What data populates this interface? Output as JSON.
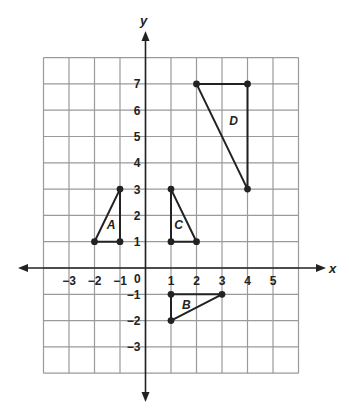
{
  "graph": {
    "x_axis_label": "x",
    "y_axis_label": "y",
    "grid": {
      "x_min": -4,
      "x_max": 6,
      "y_min": -4,
      "y_max": 8
    },
    "x_tick_labels": [
      {
        "value": -3,
        "label": "−3"
      },
      {
        "value": -2,
        "label": "−2"
      },
      {
        "value": -1,
        "label": "−1"
      },
      {
        "value": 1,
        "label": "1"
      },
      {
        "value": 2,
        "label": "2"
      },
      {
        "value": 3,
        "label": "3"
      },
      {
        "value": 4,
        "label": "4"
      },
      {
        "value": 5,
        "label": "5"
      }
    ],
    "y_tick_labels": [
      {
        "value": 7,
        "label": "7"
      },
      {
        "value": 6,
        "label": "6"
      },
      {
        "value": 5,
        "label": "5"
      },
      {
        "value": 4,
        "label": "4"
      },
      {
        "value": 3,
        "label": "3"
      },
      {
        "value": 2,
        "label": "2"
      },
      {
        "value": 1,
        "label": "1"
      },
      {
        "value": -1,
        "label": "−1"
      },
      {
        "value": -2,
        "label": "−2"
      },
      {
        "value": -3,
        "label": "−3"
      }
    ],
    "origin_label": "0",
    "triangles": [
      {
        "name": "A",
        "vertices": [
          [
            -2,
            1
          ],
          [
            -1,
            1
          ],
          [
            -1,
            3
          ]
        ],
        "label_pos": [
          -1.35,
          1.65
        ]
      },
      {
        "name": "B",
        "vertices": [
          [
            1,
            -1
          ],
          [
            3,
            -1
          ],
          [
            1,
            -2
          ]
        ],
        "label_pos": [
          1.6,
          -1.4
        ]
      },
      {
        "name": "C",
        "vertices": [
          [
            1,
            1
          ],
          [
            2,
            1
          ],
          [
            1,
            3
          ]
        ],
        "label_pos": [
          1.3,
          1.65
        ]
      },
      {
        "name": "D",
        "vertices": [
          [
            2,
            7
          ],
          [
            4,
            7
          ],
          [
            4,
            3
          ]
        ],
        "label_pos": [
          3.45,
          5.6
        ]
      }
    ]
  }
}
